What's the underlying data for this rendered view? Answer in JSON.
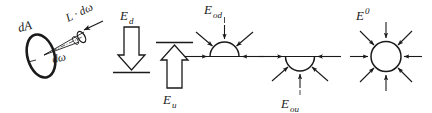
{
  "figure": {
    "background_color": "#ffffff",
    "stroke_color": "#1a1a1a",
    "width": 432,
    "height": 113
  },
  "panels": [
    {
      "id": "radiance",
      "name": "radiance-panel",
      "labels": {
        "area": "dA",
        "radiance": "L · dω",
        "solid_angle": "dω"
      },
      "elements": [
        "tilted-ellipse",
        "solid-angle-cone",
        "cone-end-ellipse",
        "direction-arrow"
      ]
    },
    {
      "id": "downward_irradiance",
      "name": "downward-irradiance-panel",
      "labels": {
        "symbol": "E",
        "subscript": "d",
        "full": "E_d"
      },
      "elements": [
        "block-arrow-down",
        "surface-line"
      ]
    },
    {
      "id": "upward_irradiance",
      "name": "upward-irradiance-panel",
      "labels": {
        "symbol": "E",
        "subscript": "u",
        "full": "E_u"
      },
      "elements": [
        "block-arrow-up",
        "surface-line"
      ]
    },
    {
      "id": "downward_scalar_irradiance",
      "name": "downward-scalar-irradiance-panel",
      "labels": {
        "symbol": "E",
        "subscript": "od",
        "full": "E_od"
      },
      "elements": [
        "upper-hemisphere",
        "horizontal-line",
        "inward-arrows"
      ],
      "arrow_count": 5
    },
    {
      "id": "upward_scalar_irradiance",
      "name": "upward-scalar-irradiance-panel",
      "labels": {
        "symbol": "E",
        "subscript": "ou",
        "full": "E_ou"
      },
      "elements": [
        "lower-hemisphere",
        "horizontal-line",
        "inward-arrows"
      ],
      "arrow_count": 5
    },
    {
      "id": "total_scalar_irradiance",
      "name": "total-scalar-irradiance-panel",
      "labels": {
        "symbol": "E",
        "superscript": "0",
        "full": "E^0"
      },
      "elements": [
        "full-circle",
        "inward-arrows"
      ],
      "arrow_count": 8
    }
  ]
}
